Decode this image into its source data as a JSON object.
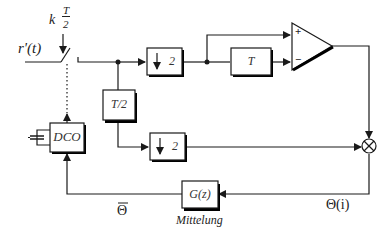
{
  "diagram": {
    "input_label": "r'(t)",
    "switch_label_k": "k",
    "switch_label_num": "T",
    "switch_label_den": "2",
    "blocks": {
      "downsample_top": "2",
      "delay_T": "T",
      "delay_T2": "T/2",
      "downsample_bottom": "2",
      "dco": "DCO",
      "filter": "G(z)"
    },
    "comparator": {
      "plus": "+",
      "minus": "−"
    },
    "multiplier_symbol": "⊗",
    "signals": {
      "theta_i": "Θ(i)",
      "theta_bar": "Θ",
      "filter_caption": "Mittelung"
    },
    "colors": {
      "line": "#1a1a1a",
      "box_fill": "#ffffff",
      "shadow": "#000000"
    }
  }
}
